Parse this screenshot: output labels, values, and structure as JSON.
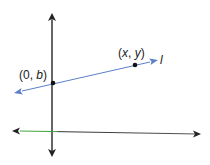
{
  "diagram": {
    "type": "coordinate-plane",
    "line": {
      "name": "l",
      "color": "#5b7fc8",
      "label": "l"
    },
    "points": [
      {
        "name": "y-intercept",
        "label_open": "(0, ",
        "label_var": "b",
        "label_close": ")"
      },
      {
        "name": "general-point",
        "label_open": "(",
        "label_var1": "x",
        "label_sep": ", ",
        "label_var2": "y",
        "label_close": ")"
      }
    ],
    "axes": {
      "color": "#333333",
      "x_axis_left_tint": "#3fa33f"
    }
  }
}
